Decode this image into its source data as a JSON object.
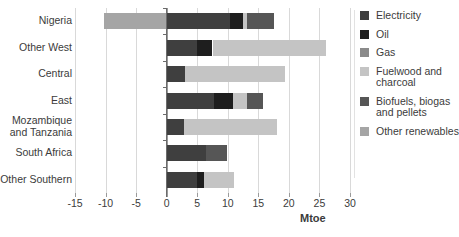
{
  "chart_data": {
    "type": "bar",
    "orientation": "horizontal",
    "stacked": true,
    "title": "",
    "xlabel": "Mtoe",
    "ylabel": "",
    "xlim": [
      -15,
      30
    ],
    "xticks": [
      -15,
      -10,
      -5,
      0,
      5,
      10,
      15,
      20,
      25,
      30
    ],
    "xticklabels": [
      "-15",
      "-10",
      "-5",
      "0",
      "5",
      "10",
      "15",
      "20",
      "25",
      "30"
    ],
    "grid": true,
    "grid_axis": "x",
    "legend_position": "right",
    "categories": [
      "Nigeria",
      "Other West",
      "Central",
      "East",
      "Mozambique and Tanzania",
      "South Africa",
      "Other Southern"
    ],
    "series": [
      {
        "name": "Electricity",
        "color": "#3f3f3f",
        "values": [
          10.3,
          5.0,
          3.0,
          7.7,
          2.8,
          6.5,
          4.9
        ]
      },
      {
        "name": "Oil",
        "color": "#1e1e1e",
        "values": [
          2.2,
          2.5,
          0.0,
          3.1,
          0.0,
          0.0,
          1.2
        ]
      },
      {
        "name": "Gas",
        "color": "#8a8a8a",
        "values": [
          0.0,
          0.0,
          0.0,
          0.0,
          0.0,
          0.0,
          0.0
        ]
      },
      {
        "name": "Fuelwood and charcoal",
        "color": "#c4c4c4",
        "values": [
          0.6,
          18.5,
          16.4,
          2.4,
          15.3,
          0.0,
          4.9
        ]
      },
      {
        "name": "Biofuels, biogas and pellets",
        "color": "#565656",
        "values": [
          4.4,
          0.0,
          0.0,
          2.5,
          0.0,
          3.3,
          0.0
        ]
      },
      {
        "name": "Other renewables",
        "color": "#a5a5a5",
        "values": [
          -10.3,
          0.0,
          0.0,
          0.0,
          0.0,
          0.0,
          0.0
        ]
      }
    ],
    "totals_positive": [
      17.5,
      26.0,
      19.4,
      15.7,
      18.1,
      9.8,
      11.0
    ],
    "totals_negative": [
      -10.3,
      0,
      0,
      0,
      0,
      0,
      0
    ]
  },
  "legend": {
    "items": [
      {
        "label": "Electricity"
      },
      {
        "label": "Oil"
      },
      {
        "label": "Gas"
      },
      {
        "label": "Fuelwood and charcoal"
      },
      {
        "label": "Biofuels, biogas and pellets"
      },
      {
        "label": "Other renewables"
      }
    ]
  }
}
